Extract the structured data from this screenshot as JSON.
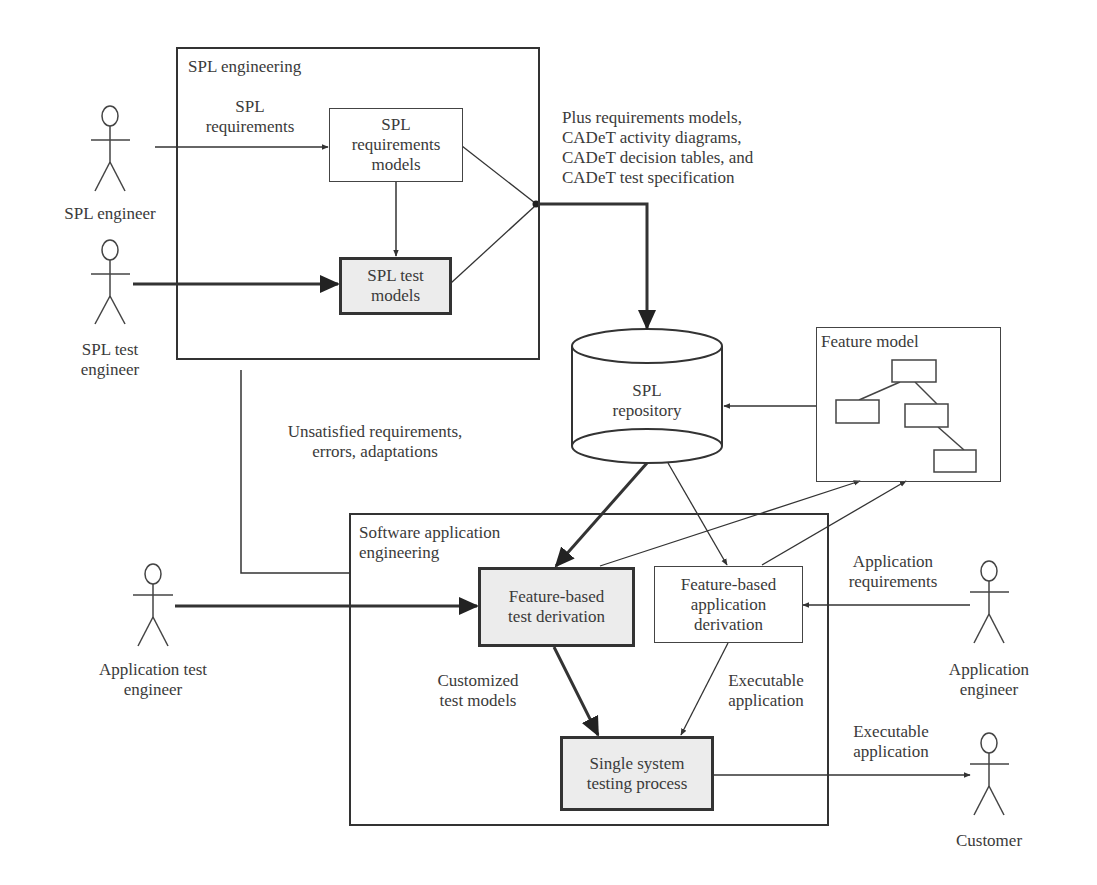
{
  "frames": {
    "spl_engineering": {
      "title": "SPL engineering"
    },
    "software_application_engineering": {
      "title": "Software application\nengineering"
    },
    "feature_model": {
      "title": "Feature model"
    }
  },
  "processes": {
    "spl_requirements_models": "SPL\nrequirements\nmodels",
    "spl_test_models": "SPL test\nmodels",
    "feature_based_test_derivation": "Feature-based\ntest derivation",
    "feature_based_application_derivation": "Feature-based\napplication\nderivation",
    "single_system_testing_process": "Single system\ntesting process"
  },
  "repository": {
    "label": "SPL\nrepository"
  },
  "actors": {
    "spl_engineer": "SPL engineer",
    "spl_test_engineer": "SPL test\nengineer",
    "application_test_engineer": "Application test\nengineer",
    "application_engineer": "Application\nengineer",
    "customer": "Customer"
  },
  "flow_labels": {
    "spl_requirements": "SPL\nrequirements",
    "repository_inputs": "Plus requirements models,\nCADeT activity diagrams,\nCADeT decision tables, and\nCADeT test specification",
    "feedback": "Unsatisfied requirements,\nerrors, adaptations",
    "application_requirements": "Application\nrequirements",
    "customized_test_models": "Customized\ntest models",
    "executable_application_internal": "Executable\napplication",
    "executable_application_customer": "Executable\napplication"
  },
  "colors": {
    "line": "#333333",
    "highlight_fill": "#ececec",
    "background": "#ffffff"
  }
}
